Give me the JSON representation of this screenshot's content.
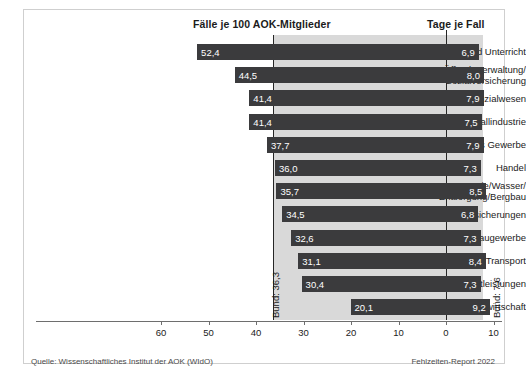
{
  "figure": {
    "header_left": "Fälle je 100 AOK-Mitglieder",
    "header_right": "Tage je Fall",
    "source": "Quelle: Wissenschaftliches Institut der AOK (WIdO)",
    "report": "Fehlzeiten-Report 2022",
    "bund_left_label": "Bund: 36,3",
    "bund_right_label": "Bund: 7,6",
    "colors": {
      "bar": "#3b3b3d",
      "band": "#d9d9d9",
      "axis": "#6e6e6e",
      "text": "#1b1b1b",
      "bar_text": "#ffffff",
      "frame": "#cfcfcf",
      "background": "#ffffff"
    }
  },
  "chart_data": {
    "type": "bar",
    "title": "",
    "subtitle": "",
    "orientation": "horizontal",
    "layout": "diverging-back-to-back",
    "grid": false,
    "legend": null,
    "xlabel_left": "Fälle je 100 AOK-Mitglieder",
    "xlabel_right": "Tage je Fall",
    "ylabel": "",
    "xlim_left": [
      0,
      60
    ],
    "xlim_right": [
      0,
      10
    ],
    "xticks_left": [
      60,
      50,
      40,
      30,
      20,
      10,
      0
    ],
    "xticks_right": [
      10
    ],
    "xtick_labels": [
      "60",
      "50",
      "40",
      "30",
      "20",
      "10",
      "0",
      "10"
    ],
    "reference_lines": [
      {
        "name": "Bund Fälle",
        "axis": "left",
        "value": 36.3,
        "label": "Bund: 36,3"
      },
      {
        "name": "Bund Tage",
        "axis": "right",
        "value": 7.6,
        "label": "Bund: 7,6"
      }
    ],
    "categories": [
      "Erziehung und Unterricht",
      "Öffentl. Verwaltung/\nSozialversicherung",
      "Gesundheits- und Sozialwesen",
      "Metallindustrie",
      "Verarbeitendes Gewerbe",
      "Handel",
      "Energie/Wasser/\nEntsorgung/Bergbau",
      "Banken/Versicherungen",
      "Baugewerbe",
      "Verkehr/Transport",
      "Dienstleistungen",
      "Land- und Forstwirtschaft"
    ],
    "series": [
      {
        "name": "Fälle je 100 AOK-Mitglieder",
        "side": "left",
        "values": [
          52.4,
          44.5,
          41.4,
          41.4,
          37.7,
          36.0,
          35.7,
          34.5,
          32.6,
          31.1,
          30.4,
          20.1
        ],
        "labels": [
          "52,4",
          "44,5",
          "41,4",
          "41,4",
          "37,7",
          "36,0",
          "35,7",
          "34,5",
          "32,6",
          "31,1",
          "30,4",
          "20,1"
        ]
      },
      {
        "name": "Tage je Fall",
        "side": "right",
        "values": [
          6.9,
          8.0,
          7.9,
          7.5,
          7.9,
          7.3,
          8.5,
          6.8,
          7.3,
          8.4,
          7.3,
          9.2
        ],
        "labels": [
          "6,9",
          "8,0",
          "7,9",
          "7,5",
          "7,9",
          "7,3",
          "8,5",
          "6,8",
          "7,3",
          "8,4",
          "7,3",
          "9,2"
        ]
      }
    ]
  }
}
